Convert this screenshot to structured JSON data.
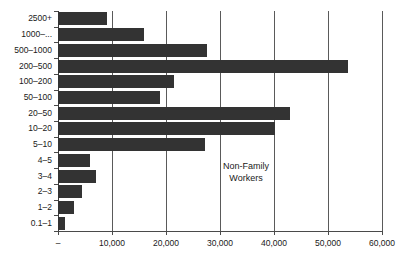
{
  "chart_data": {
    "type": "bar",
    "orientation": "horizontal",
    "title": "",
    "xlabel": "",
    "ylabel": "",
    "xlim": [
      0,
      60000
    ],
    "grid": true,
    "legend": null,
    "annotations": [
      {
        "text_line1": "Non-Family",
        "text_line2": "Workers"
      }
    ],
    "xticks": [
      0,
      10000,
      20000,
      30000,
      40000,
      50000,
      60000
    ],
    "xticklabels": [
      "–",
      "10,000",
      "20,000",
      "30,000",
      "40,000",
      "50,000",
      "60,000"
    ],
    "categories": [
      "2500+",
      "1000–...",
      "500–1000",
      "200–500",
      "100–200",
      "50–100",
      "20–50",
      "10–20",
      "5–10",
      "4–5",
      "3–4",
      "2–3",
      "1–2",
      "0.1–1"
    ],
    "values": [
      9000,
      15900,
      27500,
      53700,
      21500,
      18800,
      43000,
      40200,
      27300,
      6000,
      7000,
      4500,
      3000,
      1300
    ],
    "bar_color": "#333333",
    "grid_color": "#5a5a5a",
    "axis_color": "#4a4a4a",
    "background": "#ffffff"
  }
}
